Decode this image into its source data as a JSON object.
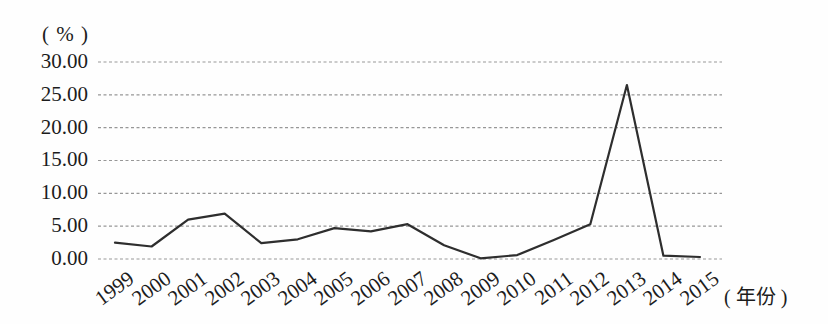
{
  "chart": {
    "y_unit_label": "( % )",
    "x_unit_label": "( 年份 )"
  },
  "chart_data": {
    "type": "line",
    "title": "",
    "xlabel": "( 年份 )",
    "ylabel": "( % )",
    "categories": [
      "1999",
      "2000",
      "2001",
      "2002",
      "2003",
      "2004",
      "2005",
      "2006",
      "2007",
      "2008",
      "2009",
      "2010",
      "2011",
      "2012",
      "2013",
      "2014",
      "2015"
    ],
    "values": [
      2.5,
      1.9,
      6.0,
      6.9,
      2.4,
      3.0,
      4.7,
      4.2,
      5.3,
      2.1,
      0.1,
      0.6,
      2.9,
      5.3,
      26.5,
      0.5,
      0.3
    ],
    "ylim": [
      0,
      30
    ],
    "yticks": [
      "30.00",
      "25.00",
      "20.00",
      "15.00",
      "10.00",
      "5.00",
      "0.00"
    ],
    "ytick_values": [
      30,
      25,
      20,
      15,
      10,
      5,
      0
    ],
    "grid": "horizontal-dashed",
    "legend": "none",
    "line_color": "#2e2e2e",
    "grid_color": "#979797"
  }
}
